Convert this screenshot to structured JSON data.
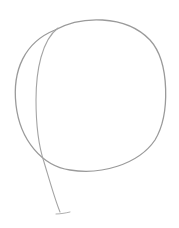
{
  "image": {
    "subject": "pencil sketch of a circle with a trailing stem line (balloon-like outline)",
    "background_color": "#ffffff",
    "stroke_color": "#9a9a9a",
    "stroke_color_light": "#b8b8b8"
  },
  "shapes": {
    "outer_circle": {
      "label": "outer circle outline",
      "path": "M 55 30 C 80 16, 125 14, 150 40 C 170 62, 170 115, 155 140 C 138 165, 100 175, 70 170 C 42 166, 20 140, 16 105 C 12 70, 25 42, 55 30"
    },
    "inner_arc_and_stem": {
      "label": "inner construction arc continuing into stem",
      "path": "M 58 28 C 42 40, 36 70, 36 100 C 36 130, 40 150, 44 162 C 50 182, 55 200, 60 212"
    },
    "stem_tail": {
      "label": "small tail stroke at bottom of stem",
      "path": "M 56 214 C 60 214, 66 213, 70 212"
    }
  }
}
